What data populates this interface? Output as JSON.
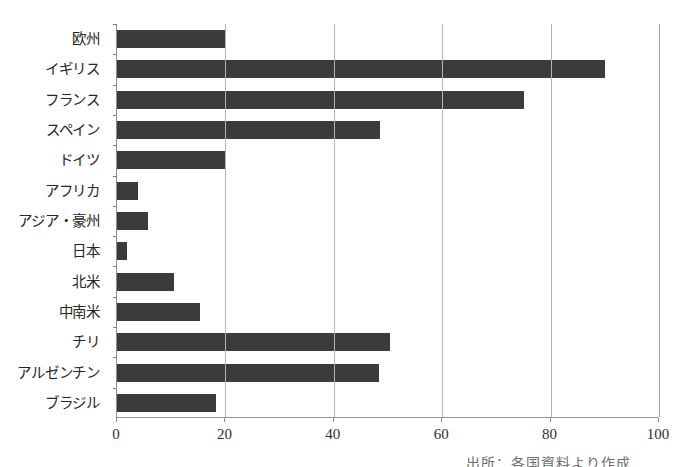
{
  "chart_data": {
    "type": "bar",
    "orientation": "horizontal",
    "title": "",
    "xlabel": "",
    "ylabel": "",
    "xlim": [
      0,
      100
    ],
    "xticks": [
      0,
      20,
      40,
      60,
      80,
      100
    ],
    "xtick_labels": [
      "0",
      "20",
      "40",
      "60",
      "80",
      "100"
    ],
    "grid": "vertical",
    "legend": "none",
    "bar_color": "#3b3b3b",
    "grid_color": "#b4b4b4",
    "axis_color": "#8d8d8d",
    "categories": [
      "欧州",
      "イギリス",
      "フランス",
      "スペイン",
      "ドイツ",
      "アフリカ",
      "アジア・豪州",
      "日本",
      "北米",
      "中南米",
      "チリ",
      "アルゼンチン",
      "ブラジル"
    ],
    "values": [
      20,
      90,
      75,
      48.5,
      20,
      3.8,
      5.8,
      1.8,
      10.5,
      15.3,
      50.4,
      48.3,
      18.3
    ]
  },
  "caption": {
    "partial_text": "出所：各国資料より作成"
  }
}
